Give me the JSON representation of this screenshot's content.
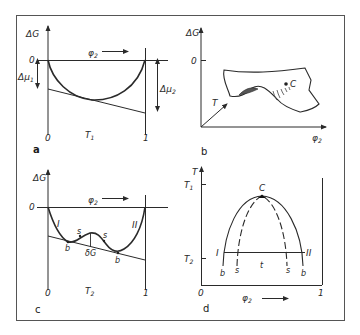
{
  "figure": {
    "panels": {
      "a": {
        "letter": "a",
        "y_label": "ΔG",
        "x_label": "φ",
        "x_label_sub": "2",
        "zero_label": "0",
        "x_start": "0",
        "x_end": "1",
        "temp_label": "T",
        "temp_sub": "1",
        "mu1_label": "Δμ",
        "mu1_sub": "1",
        "mu2_label": "Δμ",
        "mu2_sub": "2"
      },
      "b": {
        "letter": "b",
        "y_label": "ΔG",
        "zero_label": "0",
        "t_axis_label": "T",
        "x_label": "φ",
        "x_label_sub": "2",
        "critical_label": "C"
      },
      "c": {
        "letter": "c",
        "y_label": "ΔG",
        "x_label": "φ",
        "x_label_sub": "2",
        "zero_label": "0",
        "x_start": "0",
        "x_end": "1",
        "temp_label": "T",
        "temp_sub": "2",
        "phase1_label": "I",
        "phase2_label": "II",
        "binodal_label": "b",
        "spinodal_label": "s",
        "delta_g_label": "δG"
      },
      "d": {
        "letter": "d",
        "y_label": "T",
        "t1_label": "T",
        "t1_sub": "1",
        "t2_label": "T",
        "t2_sub": "2",
        "x_label": "φ",
        "x_label_sub": "2",
        "x_start": "0",
        "x_end": "1",
        "critical_label": "C",
        "phase1_label": "I",
        "phase2_label": "II",
        "binodal_label": "b",
        "spinodal_label": "s",
        "tieline_label": "t"
      }
    }
  }
}
